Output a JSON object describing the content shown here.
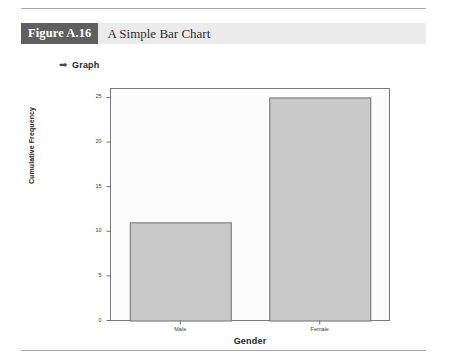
{
  "figure": {
    "number_label": "Figure A.16",
    "title": "A Simple Bar Chart"
  },
  "section": {
    "arrow_icon": "➡",
    "label": "Graph"
  },
  "chart_data": {
    "type": "bar",
    "title": "",
    "categories": [
      "Male",
      "Female"
    ],
    "values": [
      11,
      25
    ],
    "xlabel": "Gender",
    "ylabel": "Cumulative Frequency",
    "ylim": [
      0,
      26
    ],
    "yticks": [
      0,
      5,
      10,
      15,
      20,
      25
    ],
    "ytick_labels": [
      "0",
      "5",
      "10",
      "15",
      "20",
      "25"
    ],
    "grid": false,
    "legend": false,
    "bar_fill": "#c9c9c9",
    "bar_stroke": "#6e6e6e",
    "plot_background": "#fbfbfb",
    "plot_border": "#7a7a7a"
  }
}
